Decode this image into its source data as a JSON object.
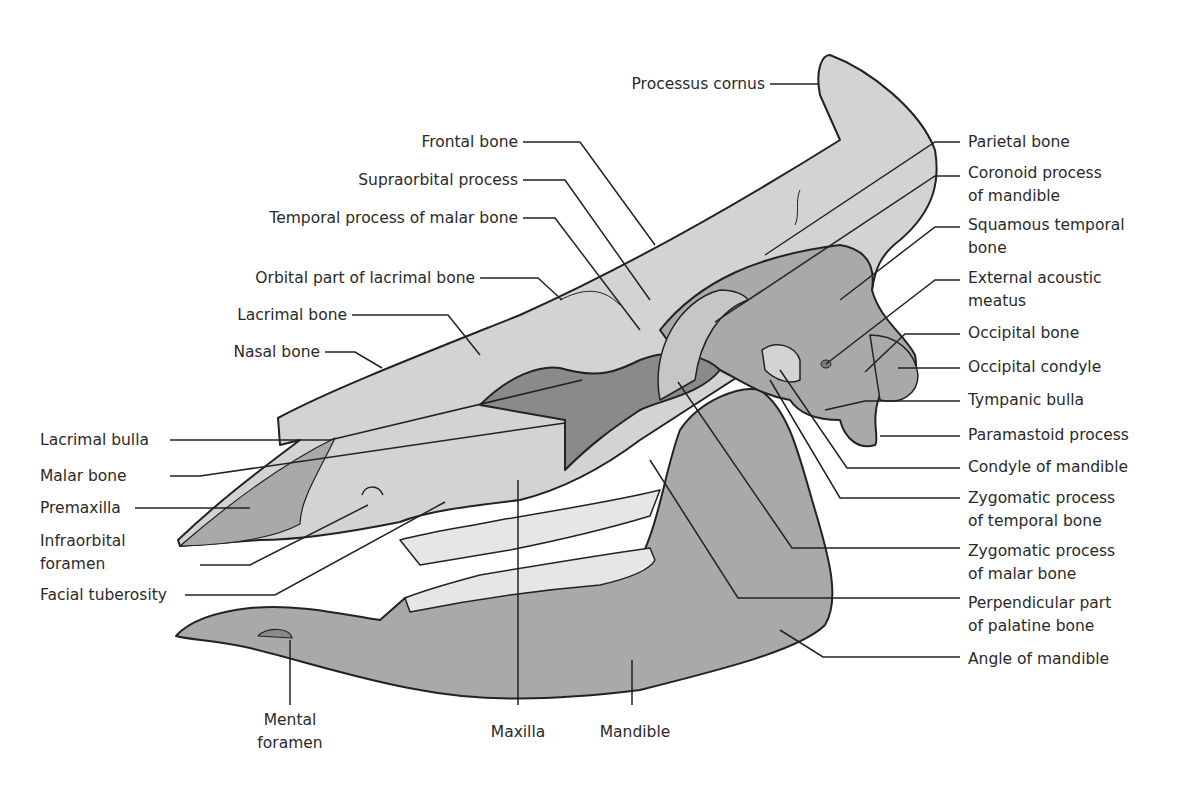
{
  "diagram": {
    "colors": {
      "background": "#ffffff",
      "bone_light": "#d3d3d3",
      "bone_medium": "#a9a9a9",
      "bone_dark": "#8a8a8a",
      "teeth": "#e6e6e6",
      "outline": "#222222",
      "leader_line": "#222222",
      "text": "#2a2a2a"
    },
    "labels": {
      "processus_cornus": "Processus cornus",
      "frontal_bone": "Frontal bone",
      "supraorbital_process": "Supraorbital process",
      "temporal_process_malar": "Temporal process of malar bone",
      "orbital_part_lacrimal": "Orbital part of lacrimal bone",
      "lacrimal_bone": "Lacrimal bone",
      "nasal_bone": "Nasal bone",
      "lacrimal_bulla": "Lacrimal bulla",
      "malar_bone": "Malar bone",
      "premaxilla": "Premaxilla",
      "infraorbital_foramen": "Infraorbital\nforamen",
      "facial_tuberosity": "Facial tuberosity",
      "mental_foramen": "Mental\nforamen",
      "maxilla": "Maxilla",
      "mandible": "Mandible",
      "parietal_bone": "Parietal bone",
      "coronoid_process": "Coronoid process\nof mandible",
      "squamous_temporal": "Squamous temporal\nbone",
      "external_acoustic_meatus": "External acoustic\nmeatus",
      "occipital_bone": "Occipital bone",
      "occipital_condyle": "Occipital condyle",
      "tympanic_bulla": "Tympanic bulla",
      "paramastoid_process": "Paramastoid process",
      "condyle_of_mandible": "Condyle of mandible",
      "zygomatic_process_temporal": "Zygomatic process\nof temporal bone",
      "zygomatic_process_malar": "Zygomatic process\nof malar bone",
      "perpendicular_palatine": "Perpendicular part\nof palatine bone",
      "angle_of_mandible": "Angle of mandible"
    }
  }
}
